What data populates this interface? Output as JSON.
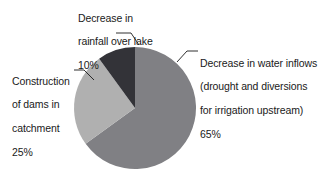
{
  "chart_data": {
    "type": "pie",
    "title": "",
    "subtitle": "",
    "xlabel": "",
    "ylabel": "",
    "legend_position": "none",
    "grid": false,
    "units": "%",
    "categories": [
      "Decrease in water inflows (drought and diversions for irrigation upstream)",
      "Construction of dams in catchment",
      "Decrease in rainfall over lake"
    ],
    "values": [
      65,
      25,
      10
    ],
    "slices": [
      {
        "name": "decrease-in-water-inflows",
        "label_lines": [
          "Decrease in water inflows",
          "(drought and diversions",
          "for irrigation upstream)",
          "65%"
        ],
        "value": 65,
        "value_label": "65%",
        "color": "#808084",
        "start_angle_deg": 0,
        "end_angle_deg": 234
      },
      {
        "name": "construction-of-dams-in-catchment",
        "label_lines": [
          "Construction",
          "of dams in",
          "catchment",
          "25%"
        ],
        "value": 25,
        "value_label": "25%",
        "color": "#b0b0b0",
        "start_angle_deg": 234,
        "end_angle_deg": 324
      },
      {
        "name": "decrease-in-rainfall-over-lake",
        "label_lines": [
          "Decrease in",
          "rainfall over lake",
          "10%"
        ],
        "value": 10,
        "value_label": "10%",
        "color": "#333338",
        "start_angle_deg": 324,
        "end_angle_deg": 360
      }
    ]
  },
  "labels": {
    "rainfall": {
      "line1": "Decrease in",
      "line2": "rainfall over lake",
      "line3": "10%"
    },
    "inflows": {
      "line1": "Decrease in water inflows",
      "line2": "(drought and diversions",
      "line3": "for irrigation upstream)",
      "line4": "65%"
    },
    "dams": {
      "line1": "Construction",
      "line2": "of dams in",
      "line3": "catchment",
      "line4": "25%"
    }
  },
  "geometry": {
    "center_x": 135,
    "center_y": 108,
    "radius": 61
  },
  "colors": {
    "background": "#ffffff",
    "text": "#1a1a1a",
    "leader_line": "#1a1a1a",
    "slice_inflows": "#808084",
    "slice_dams": "#b0b0b0",
    "slice_rainfall": "#333338"
  }
}
